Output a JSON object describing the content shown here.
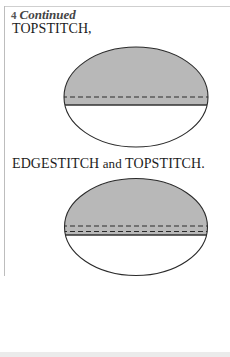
{
  "step": {
    "number": "4",
    "continued_label": "Continued"
  },
  "figures": [
    {
      "caption": "TOPSTITCH,",
      "stitch_lines": 1,
      "fill_color": "#b8b8b8"
    },
    {
      "caption_parts": [
        "EDGESTITCH",
        " and ",
        "TOPSTITCH."
      ],
      "stitch_lines": 2,
      "fill_color": "#b8b8b8"
    }
  ]
}
